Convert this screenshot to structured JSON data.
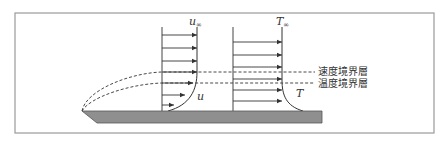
{
  "diagram": {
    "labels": {
      "u_inf": "u",
      "u_inf_sub": "∞",
      "u": "u",
      "T_inf": "T",
      "T_inf_sub": "∞",
      "T": "T",
      "velocity_boundary_layer": "速度境界層",
      "thermal_boundary_layer": "温度境界層"
    },
    "colors": {
      "frame": "#9a9a9a",
      "plate": "#8f8f8f",
      "line": "#333333"
    },
    "frame": {
      "x": 15,
      "y": 13,
      "w": 419,
      "h": 120
    },
    "plate": {
      "points": "82,111 322,111 322,123 97,123"
    },
    "velocity_profile": {
      "axis_x": 162,
      "axis_top": 27,
      "axis_bottom": 111,
      "arrows": [
        {
          "y": 35,
          "tip": 197
        },
        {
          "y": 48,
          "tip": 197
        },
        {
          "y": 61,
          "tip": 197
        },
        {
          "y": 72,
          "tip": 197
        },
        {
          "y": 83,
          "tip": 193
        },
        {
          "y": 95,
          "tip": 185
        },
        {
          "y": 105,
          "tip": 174
        }
      ],
      "curve": "M197,27 L197,72 C197,90 190,105 168,111"
    },
    "temperature_profile": {
      "axis_x": 233,
      "axis_top": 27,
      "axis_bottom": 111,
      "arrows": [
        {
          "y": 42,
          "tip": 282
        },
        {
          "y": 55,
          "tip": 282
        },
        {
          "y": 67,
          "tip": 282
        },
        {
          "y": 79,
          "tip": 282
        },
        {
          "y": 90,
          "tip": 282
        },
        {
          "y": 101,
          "tip": 282
        }
      ],
      "curve": "M282,27 L282,80 C282,95 286,106 303,111"
    },
    "boundary_layers": {
      "velocity_path": "M82,111 C86,90 130,73 162,72 L315,72",
      "thermal_path": "M82,111 C90,97 130,84 162,83 L315,83"
    }
  }
}
